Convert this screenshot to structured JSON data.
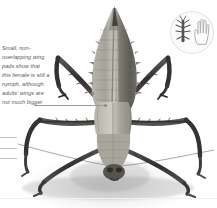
{
  "figure": {
    "background_color": "#ffffff",
    "shadow_color": "#787878"
  },
  "caption": {
    "text": "Small, non-overlapping wing pads show that this female is still a nymph, although adults' wings are not much bigger",
    "style": "italic",
    "color": "#5d5d5d",
    "leader_target": "wing-pads-on-thorax"
  },
  "leader_lines": {
    "main_color": "#9a9a9a",
    "stub_color": "#c4c4c4",
    "stub_count": 3
  },
  "scale_badge": {
    "name": "size-comparison-badge",
    "disc_color": "#fbfbfb",
    "border_color": "#e2e2e2",
    "insect_silhouette_color": "#4a4a4a",
    "hand_outline_color": "#b4b4b4",
    "items": [
      "insect-silhouette",
      "human-hand-outline"
    ]
  },
  "rules": {
    "color": "#ededed",
    "bottom_color": "#f0f0f0"
  },
  "insect_colors": {
    "abdomen_light": "#c9c6bd",
    "abdomen_mid": "#9d9a92",
    "abdomen_dark": "#4f4d48",
    "thorax": "#b3b0a6",
    "leg_dark": "#3a3836",
    "leg_mid": "#6e6b66",
    "antenna": "#8f8d88"
  }
}
